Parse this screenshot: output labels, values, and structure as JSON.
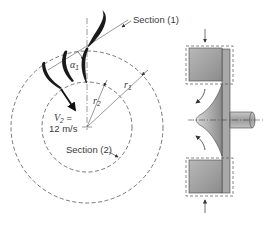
{
  "diagram": {
    "type": "centrifugal-pump-impeller",
    "labels": {
      "section1": "Section (1)",
      "section2": "Section (2)",
      "r1": "r",
      "r1_sub": "1",
      "r2": "r",
      "r2_sub": "2",
      "alpha1": "α",
      "alpha1_sub": "1",
      "v2_symbol": "V",
      "v2_sub": "2",
      "v2_eq": " =",
      "v2_value": "12 m/s"
    },
    "colors": {
      "line": "#555555",
      "blade": "#1a1a1a",
      "housing_fill": "#9a9a9a",
      "background": "#ffffff"
    },
    "views": [
      "top-view-impeller",
      "side-view-cross-section"
    ]
  }
}
